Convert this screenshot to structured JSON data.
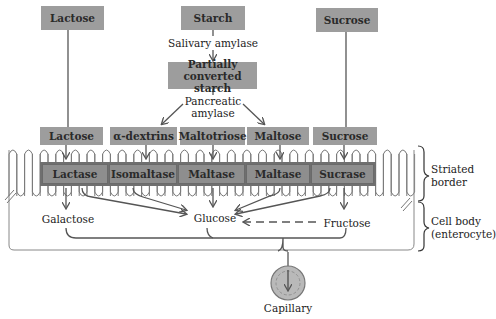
{
  "diagram": {
    "colors": {
      "box_fill": "#9d9d9d",
      "enzyme_band": "#7d7d7d",
      "line": "#555555",
      "capillary": "#b5b5b5"
    },
    "top_row": [
      {
        "id": "lactose_top",
        "label": "Lactose"
      },
      {
        "id": "starch",
        "label": "Starch"
      },
      {
        "id": "sucrose_top",
        "label": "Sucrose"
      }
    ],
    "salivary_enzyme": "Salivary amylase",
    "partial_starch": "Partially converted starch",
    "partial_starch_line1": "Partially",
    "partial_starch_line2": "converted starch",
    "pancreatic_line1": "Pancreatic",
    "pancreatic_line2": "amylase",
    "substrates": [
      {
        "label": "Lactose"
      },
      {
        "label": "α-dextrins"
      },
      {
        "label": "Maltotriose"
      },
      {
        "label": "Maltose"
      },
      {
        "label": "Sucrose"
      }
    ],
    "enzymes": [
      {
        "label": "Lactase"
      },
      {
        "label": "Isomaltase"
      },
      {
        "label": "Maltase"
      },
      {
        "label": "Maltase"
      },
      {
        "label": "Sucrase"
      }
    ],
    "products": {
      "galactose": "Galactose",
      "glucose": "Glucose",
      "fructose": "Fructose"
    },
    "capillary": "Capillary",
    "regions": {
      "striated_line1": "Striated",
      "striated_line2": "border",
      "cell_line1": "Cell body",
      "cell_line2": "(enterocyte)"
    },
    "edges": [
      {
        "from": "Starch",
        "to": "Partially converted starch",
        "label": "Salivary amylase"
      },
      {
        "from": "Partially converted starch",
        "to": "α-dextrins",
        "label": "Pancreatic amylase"
      },
      {
        "from": "Partially converted starch",
        "to": "Maltose",
        "label": "Pancreatic amylase"
      },
      {
        "from": "Lactose (top)",
        "to": "Lactose"
      },
      {
        "from": "Sucrose (top)",
        "to": "Sucrose"
      },
      {
        "from": "Lactase",
        "to": "Galactose"
      },
      {
        "from": "Lactase",
        "to": "Glucose"
      },
      {
        "from": "Isomaltase",
        "to": "Glucose"
      },
      {
        "from": "Maltase",
        "to": "Glucose"
      },
      {
        "from": "Maltase (2)",
        "to": "Glucose"
      },
      {
        "from": "Sucrase",
        "to": "Glucose"
      },
      {
        "from": "Sucrase",
        "to": "Fructose"
      },
      {
        "from": "Fructose",
        "to": "Glucose",
        "style": "dashed"
      },
      {
        "from": "Galactose + Glucose + Fructose",
        "to": "Capillary"
      }
    ]
  }
}
